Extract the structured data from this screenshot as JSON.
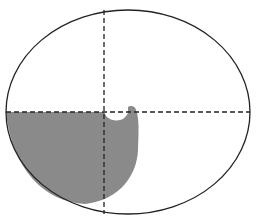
{
  "diagram": {
    "type": "geometric-figure",
    "ellipse": {
      "cx": 128,
      "cy": 112,
      "rx": 122,
      "ry": 102,
      "stroke": "#222222"
    },
    "axes": {
      "vertical_x": 104,
      "horizontal_y": 112,
      "style": "dashed",
      "color": "#222222"
    },
    "shaded_region": {
      "fill": "#8a8a8a",
      "description": "lower-left quadrant region with hook-shaped extension and circular notch"
    }
  }
}
